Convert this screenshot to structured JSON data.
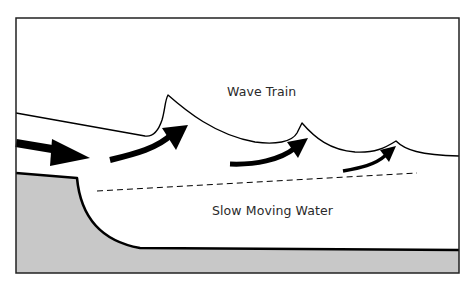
{
  "diagram": {
    "title": "",
    "labels": {
      "wave_train": "Wave Train",
      "slow_moving_water": "Slow Moving Water"
    },
    "colors": {
      "background": "#ffffff",
      "ground_fill": "#c8c8c8",
      "line": "#000000",
      "frame": "#222222"
    },
    "elements": [
      {
        "name": "frame",
        "type": "rectangle"
      },
      {
        "name": "riverbed",
        "type": "filled-region",
        "description": "grey ground with a step-drop that curves down into a flat bed"
      },
      {
        "name": "water-surface",
        "type": "line",
        "description": "sloping surface rising into three successively smaller wave crests"
      },
      {
        "name": "inflow-arrow",
        "type": "arrow",
        "description": "large straight arrow entering from the left"
      },
      {
        "name": "wave-arrows",
        "type": "arrow",
        "count": 3,
        "description": "curved arrows pointing up toward each wave crest, decreasing in size"
      },
      {
        "name": "dashed-boundary",
        "type": "dashed-line",
        "description": "boundary between wave train and slow moving water"
      }
    ]
  }
}
